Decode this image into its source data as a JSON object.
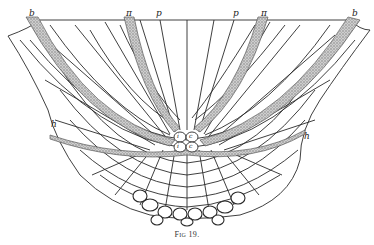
{
  "figure": {
    "caption_prefix": "Fig",
    "caption_number": "19.",
    "labels": {
      "b_left": "b",
      "pi_left": "π",
      "p_left": "p",
      "p_right": "p",
      "pi_right": "π",
      "b_right": "b",
      "h_left": "h",
      "h_right": "h",
      "center_labels": [
        "i",
        "c",
        "i",
        "c"
      ]
    },
    "colors": {
      "ink": "#2a2a2a",
      "stipple": "#9a9a9a",
      "paper": "#ffffff"
    }
  }
}
